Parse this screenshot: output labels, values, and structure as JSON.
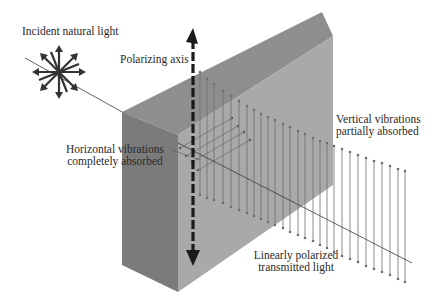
{
  "diagram": {
    "labels": {
      "incident": "Incident natural light",
      "axis": "Polarizing axis",
      "horizontal_line1": "Horizontal vibrations",
      "horizontal_line2": "completely absorbed",
      "vertical_line1": "Vertical vibrations",
      "vertical_line2": "partially absorbed",
      "transmitted_line1": "Linearly polarized",
      "transmitted_line2": "transmitted light"
    },
    "colors": {
      "background": "#ffffff",
      "top_face": "#8c8c8c",
      "left_face": "#7a7a7a",
      "front_face": "#a8a8a8",
      "axis_arrow": "#1a1a1a",
      "vibration_lines": "#6e6e6e",
      "beam": "#3a3a3a",
      "text": "#2a2a2a"
    },
    "icons": {
      "incident_star": "eight-direction-arrow-star-icon",
      "axis_arrow": "double-headed-dashed-arrow-icon"
    }
  }
}
